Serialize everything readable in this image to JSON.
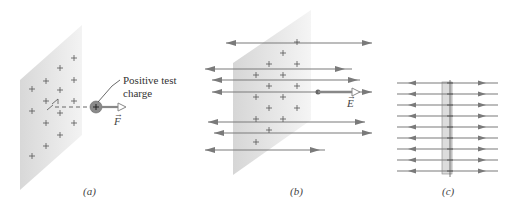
{
  "figure": {
    "panels": [
      {
        "id": "a",
        "caption": "(a)",
        "annotation_line1": "Positive test",
        "annotation_line2": "charge",
        "vector_label": "F",
        "charge_symbol": "+"
      },
      {
        "id": "b",
        "caption": "(b)",
        "vector_label": "E"
      },
      {
        "id": "c",
        "caption": "(c)"
      }
    ],
    "colors": {
      "plate": "#dcdcdc",
      "field_line": "#7a7a7a",
      "charge_mark": "#555555",
      "test_charge": "#8a8a8a",
      "text": "#333333"
    },
    "vector_arrow_glyph": "→"
  }
}
